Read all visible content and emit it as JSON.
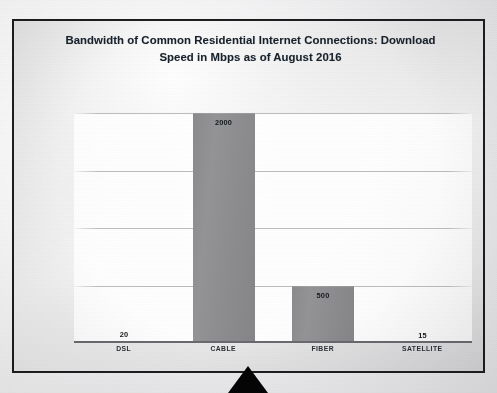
{
  "slide": {
    "title_line1": "Bandwidth of Common Residential Internet Connections: Download",
    "title_line2": "Speed in Mbps as of August 2016"
  },
  "chart_data": {
    "type": "bar",
    "title": "Bandwidth of Common Residential Internet Connections: Download Speed in Mbps as of August 2016",
    "categories": [
      "DSL",
      "CABLE",
      "FIBER",
      "SATELLITE"
    ],
    "values": [
      20,
      2000,
      500,
      15
    ],
    "value_labels": [
      "20",
      "2000",
      "500",
      "15"
    ],
    "xlabel": "",
    "ylabel": "",
    "ylim": [
      0,
      2000
    ],
    "gridlines": [
      500,
      1000,
      1500,
      2000
    ],
    "grid": true,
    "legend": "none",
    "axis_tick_labels": [],
    "bar_color": "#8e8e90",
    "gridline_color": "#b0b0b3",
    "axis_color": "#6a6a6e",
    "label_color": "#14181d"
  },
  "decor": {
    "pointer_name": "triangle-pointer",
    "frame_color": "#1d1d1f"
  }
}
